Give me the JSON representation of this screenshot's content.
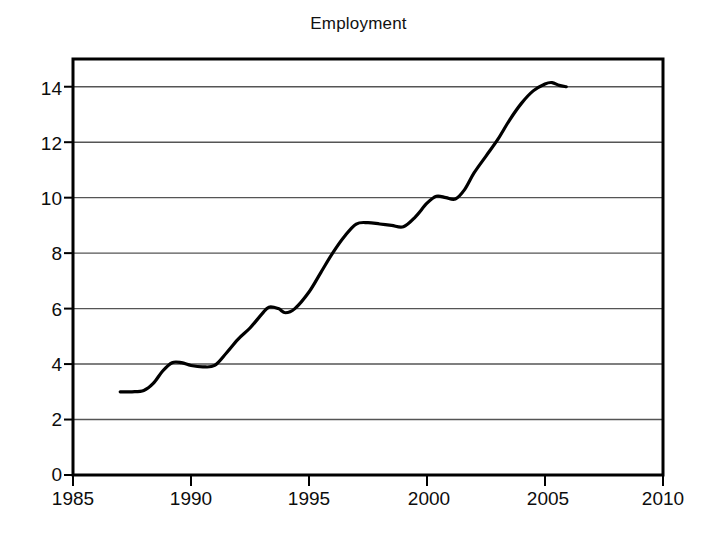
{
  "chart_data": {
    "type": "line",
    "title": "Employment",
    "xlabel": "",
    "ylabel": "",
    "xlim": [
      1985,
      2010
    ],
    "ylim": [
      0,
      15
    ],
    "grid": true,
    "legend_position": "none",
    "x_ticks": [
      "1985",
      "1990",
      "1995",
      "2000",
      "2005",
      "2010"
    ],
    "x_tick_values": [
      1985,
      1990,
      1995,
      2000,
      2005,
      2010
    ],
    "y_ticks": [
      "0",
      "2",
      "4",
      "6",
      "8",
      "10",
      "12",
      "14"
    ],
    "y_tick_values": [
      0,
      2,
      4,
      6,
      8,
      10,
      12,
      14
    ],
    "series": [
      {
        "name": "Employment",
        "color": "#000000",
        "line_width": 3.2,
        "x": [
          1987.0,
          1987.5,
          1988.0,
          1988.4,
          1988.8,
          1989.2,
          1989.6,
          1990.0,
          1990.5,
          1991.0,
          1991.5,
          1992.0,
          1992.5,
          1993.0,
          1993.3,
          1993.7,
          1994.0,
          1994.4,
          1995.0,
          1995.5,
          1996.0,
          1996.5,
          1997.0,
          1997.5,
          1998.0,
          1998.5,
          1999.0,
          1999.5,
          2000.0,
          2000.4,
          2000.8,
          2001.2,
          2001.6,
          2002.0,
          2002.5,
          2003.0,
          2003.5,
          2004.0,
          2004.5,
          2005.0,
          2005.3,
          2005.6,
          2005.9
        ],
        "y": [
          3.0,
          3.0,
          3.05,
          3.3,
          3.75,
          4.05,
          4.05,
          3.95,
          3.9,
          3.95,
          4.4,
          4.9,
          5.3,
          5.8,
          6.05,
          6.0,
          5.85,
          6.0,
          6.6,
          7.3,
          8.0,
          8.6,
          9.05,
          9.1,
          9.05,
          9.0,
          8.95,
          9.3,
          9.8,
          10.05,
          10.0,
          9.95,
          10.3,
          10.9,
          11.5,
          12.1,
          12.8,
          13.4,
          13.85,
          14.1,
          14.15,
          14.05,
          14.0
        ]
      }
    ]
  }
}
